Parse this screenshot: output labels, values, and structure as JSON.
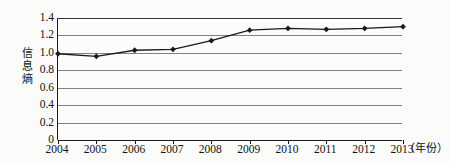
{
  "chart_data": {
    "type": "line",
    "title": "",
    "subtitle": "",
    "xlabel": "（年份）",
    "ylabel": "信息熵",
    "categories": [
      "2004",
      "2005",
      "2006",
      "2007",
      "2008",
      "2009",
      "2010",
      "2011",
      "2012",
      "2013"
    ],
    "x": [
      2004,
      2005,
      2006,
      2007,
      2008,
      2009,
      2010,
      2011,
      2012,
      2013
    ],
    "values": [
      0.99,
      0.96,
      1.03,
      1.04,
      1.14,
      1.26,
      1.28,
      1.27,
      1.28,
      1.3
    ],
    "series": [
      {
        "name": "信息熵",
        "values": [
          0.99,
          0.96,
          1.03,
          1.04,
          1.14,
          1.26,
          1.28,
          1.27,
          1.28,
          1.3
        ]
      }
    ],
    "ylim": [
      0,
      1.4
    ],
    "yticks": [
      0,
      0.2,
      0.4,
      0.6,
      0.8,
      1.0,
      1.2,
      1.4
    ],
    "ytick_labels": [
      "0",
      "0.2",
      "0.4",
      "0.6",
      "0.8",
      "1.0",
      "1.2",
      "1.4"
    ],
    "grid": true,
    "grid_axis": "y",
    "legend": false,
    "legend_position": "none",
    "marker": "diamond",
    "line_color": "#1a1a1a",
    "marker_color": "#1a1a1a",
    "grid_color": "#808080",
    "axis_color": "#1a1a1a",
    "plot_background": "#fcfcfb",
    "figure_background": "#fbfbfa"
  },
  "axes": {
    "y_title_chars": "信\n息\n熵",
    "x_title": "（年份）"
  }
}
